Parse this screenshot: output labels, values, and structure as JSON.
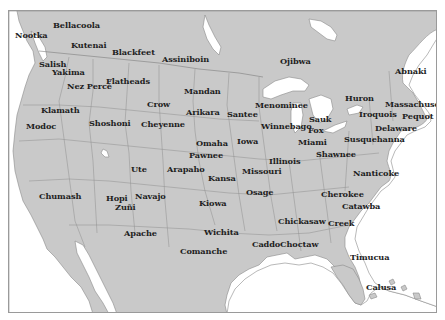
{
  "map": {
    "title": "Native American peoples of North America",
    "colors": {
      "land": "#c9c9c9",
      "water": "#ffffff",
      "border": "#7e7e7e",
      "frame": "#9a9a9a",
      "label": "#1e1e1e"
    },
    "labels": [
      {
        "name": "Bellacoola",
        "x": 52,
        "y": 24
      },
      {
        "name": "Nootka",
        "x": 14,
        "y": 34
      },
      {
        "name": "Kutenai",
        "x": 70,
        "y": 44
      },
      {
        "name": "Blackfeet",
        "x": 111,
        "y": 51
      },
      {
        "name": "Assiniboin",
        "x": 161,
        "y": 58
      },
      {
        "name": "Ojibwa",
        "x": 279,
        "y": 60
      },
      {
        "name": "Abnaki",
        "x": 394,
        "y": 70
      },
      {
        "name": "Salish",
        "x": 38,
        "y": 63
      },
      {
        "name": "Yakima",
        "x": 51,
        "y": 71
      },
      {
        "name": "Nez Percé",
        "x": 66,
        "y": 85
      },
      {
        "name": "Flatheads",
        "x": 105,
        "y": 80
      },
      {
        "name": "Mandan",
        "x": 183,
        "y": 90
      },
      {
        "name": "Huron",
        "x": 344,
        "y": 97
      },
      {
        "name": "Massachuset",
        "x": 384,
        "y": 103
      },
      {
        "name": "Pequot",
        "x": 401,
        "y": 115
      },
      {
        "name": "Menominee",
        "x": 254,
        "y": 104
      },
      {
        "name": "Crow",
        "x": 146,
        "y": 103
      },
      {
        "name": "Iroquois",
        "x": 358,
        "y": 113
      },
      {
        "name": "Klamath",
        "x": 40,
        "y": 109
      },
      {
        "name": "Arikara",
        "x": 185,
        "y": 111
      },
      {
        "name": "Santee",
        "x": 226,
        "y": 113
      },
      {
        "name": "Winnebago",
        "x": 260,
        "y": 125
      },
      {
        "name": "Sauk",
        "x": 308,
        "y": 118
      },
      {
        "name": "Delaware",
        "x": 374,
        "y": 127
      },
      {
        "name": "Modoc",
        "x": 25,
        "y": 125
      },
      {
        "name": "Shoshoni",
        "x": 88,
        "y": 122
      },
      {
        "name": "Cheyenne",
        "x": 140,
        "y": 123
      },
      {
        "name": "Fox",
        "x": 307,
        "y": 129
      },
      {
        "name": "Miami",
        "x": 297,
        "y": 141
      },
      {
        "name": "Susquehanna",
        "x": 343,
        "y": 138
      },
      {
        "name": "Iowa",
        "x": 236,
        "y": 140
      },
      {
        "name": "Omaha",
        "x": 195,
        "y": 142
      },
      {
        "name": "Illinois",
        "x": 268,
        "y": 160
      },
      {
        "name": "Shawnee",
        "x": 315,
        "y": 153
      },
      {
        "name": "Pawnee",
        "x": 188,
        "y": 154
      },
      {
        "name": "Ute",
        "x": 130,
        "y": 168
      },
      {
        "name": "Arapaho",
        "x": 166,
        "y": 168
      },
      {
        "name": "Missouri",
        "x": 241,
        "y": 170
      },
      {
        "name": "Kansa",
        "x": 207,
        "y": 177
      },
      {
        "name": "Nanticoke",
        "x": 352,
        "y": 172
      },
      {
        "name": "Chumash",
        "x": 38,
        "y": 195
      },
      {
        "name": "Osage",
        "x": 245,
        "y": 191
      },
      {
        "name": "Hopi",
        "x": 105,
        "y": 197
      },
      {
        "name": "Navajo",
        "x": 134,
        "y": 195
      },
      {
        "name": "Kiowa",
        "x": 198,
        "y": 202
      },
      {
        "name": "Cherokee",
        "x": 320,
        "y": 193
      },
      {
        "name": "Zuñi",
        "x": 114,
        "y": 206
      },
      {
        "name": "Catawba",
        "x": 341,
        "y": 205
      },
      {
        "name": "Chickasaw",
        "x": 277,
        "y": 220
      },
      {
        "name": "Creek",
        "x": 327,
        "y": 222
      },
      {
        "name": "Apache",
        "x": 123,
        "y": 232
      },
      {
        "name": "Wichita",
        "x": 203,
        "y": 231
      },
      {
        "name": "Caddo",
        "x": 251,
        "y": 243
      },
      {
        "name": "Choctaw",
        "x": 279,
        "y": 243
      },
      {
        "name": "Comanche",
        "x": 179,
        "y": 250
      },
      {
        "name": "Timucua",
        "x": 349,
        "y": 256
      },
      {
        "name": "Calusa",
        "x": 365,
        "y": 286
      }
    ]
  }
}
